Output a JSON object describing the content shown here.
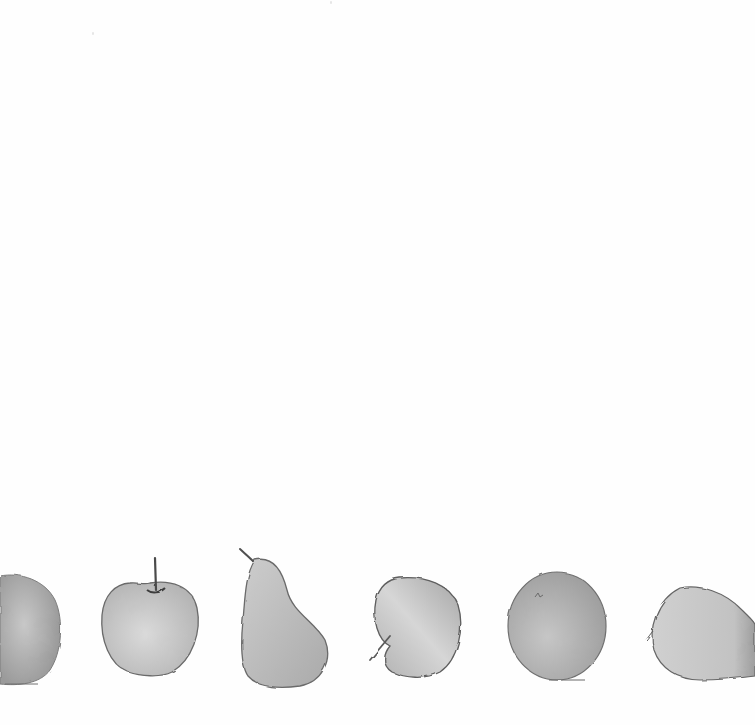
{
  "illustration": {
    "style": "grayscale watercolor",
    "background": "#fefefe",
    "fruits": [
      {
        "kind": "apple",
        "label": "round fruit (cropped at left edge)",
        "fill": "#a9a9a9"
      },
      {
        "kind": "apple",
        "label": "apple with upright stem",
        "fill": "#c4c4c4"
      },
      {
        "kind": "pear",
        "label": "pear",
        "fill": "#bdbdbd"
      },
      {
        "kind": "apple",
        "label": "tilted apple with stem at left",
        "fill": "#c0c0c0"
      },
      {
        "kind": "orange",
        "label": "round fruit / orange",
        "fill": "#b3b3b3"
      },
      {
        "kind": "apple",
        "label": "sideways fruit (cropped at right edge)",
        "fill": "#c6c6c6"
      }
    ]
  }
}
